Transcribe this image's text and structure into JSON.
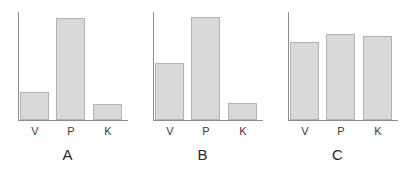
{
  "figure": {
    "background_color": "#ffffff",
    "bar_fill_color": "#d9d9d9",
    "bar_border_color": "#b3b3b3",
    "axis_color": "#8e8e8e",
    "label_color": "#2b2b2b"
  },
  "chart_data": [
    {
      "type": "bar",
      "title": "A",
      "categories": [
        "V",
        "P",
        "K"
      ],
      "values": [
        26,
        94,
        15
      ],
      "xlabel": "",
      "ylabel": "",
      "ylim": [
        0,
        100
      ],
      "grid": false,
      "legend": "none"
    },
    {
      "type": "bar",
      "title": "B",
      "categories": [
        "V",
        "P",
        "K"
      ],
      "values": [
        53,
        95,
        16
      ],
      "xlabel": "",
      "ylabel": "",
      "ylim": [
        0,
        100
      ],
      "grid": false,
      "legend": "none"
    },
    {
      "type": "bar",
      "title": "C",
      "categories": [
        "V",
        "P",
        "K"
      ],
      "values": [
        72,
        80,
        78
      ],
      "xlabel": "",
      "ylabel": "",
      "ylim": [
        0,
        100
      ],
      "grid": false,
      "legend": "none"
    }
  ]
}
